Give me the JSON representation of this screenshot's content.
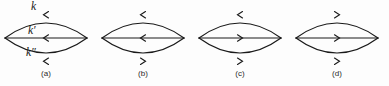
{
  "figure": {
    "kind": "feynman-diagram-set",
    "stroke_color": "#1a1a1a",
    "background_color": "#fdfdfd",
    "panel_count": 4,
    "geometry": {
      "lens_top_y": 14,
      "lens_bottom_y": 62,
      "lens_mid_y": 38,
      "lens_half_width": 41,
      "panel_centers_x": [
        46,
        143,
        240,
        337
      ]
    }
  },
  "momentum_labels": {
    "top": "k",
    "middle": "k′",
    "bottom": "k″"
  },
  "panels": [
    {
      "caption": "(a)",
      "center_x": 46,
      "arrows": {
        "top": "left",
        "middle": "left",
        "bottom": "left"
      }
    },
    {
      "caption": "(b)",
      "center_x": 143,
      "arrows": {
        "top": "left",
        "middle": "left",
        "bottom": "right"
      }
    },
    {
      "caption": "(c)",
      "center_x": 240,
      "arrows": {
        "top": "left",
        "middle": "right",
        "bottom": "right"
      }
    },
    {
      "caption": "(d)",
      "center_x": 337,
      "arrows": {
        "top": "right",
        "middle": "right",
        "bottom": "right"
      }
    }
  ]
}
